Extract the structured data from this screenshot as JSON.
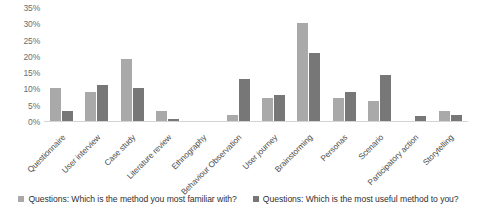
{
  "chart_data": {
    "type": "bar",
    "title": "",
    "subtitle": "",
    "xlabel": "",
    "ylabel": "",
    "ylim": [
      0,
      35
    ],
    "ytick_labels": [
      "35%",
      "30%",
      "25%",
      "20%",
      "15%",
      "10%",
      "5%",
      "0%"
    ],
    "ytick_values": [
      35,
      30,
      25,
      20,
      15,
      10,
      5,
      0
    ],
    "grid": false,
    "legend_position": "bottom",
    "value_unit": "%",
    "categories": [
      "Questionnaire",
      "User interview",
      "Case study",
      "Literature review",
      "Ethnography",
      "Behaviour Observation",
      "User journey",
      "Brainstorming",
      "Personas",
      "Scenario",
      "Participatory action",
      "Storytelling"
    ],
    "series": [
      {
        "name": "Questions: Which is the method you most familiar with?",
        "color": "#a9a9a9",
        "values": [
          10,
          9,
          19,
          3,
          0,
          2,
          7,
          30,
          7,
          6,
          0,
          3
        ]
      },
      {
        "name": "Questions: Which is the most useful method to you?",
        "color": "#777777",
        "values": [
          3,
          11,
          10,
          0.5,
          0,
          13,
          8,
          21,
          9,
          14,
          1.5,
          2
        ]
      }
    ]
  },
  "legend": {
    "items": [
      {
        "marker": "legend-swatch-series-1",
        "label": "Questions: Which is the method you most familiar with?"
      },
      {
        "marker": "legend-swatch-series-2",
        "label": "Questions: Which is the most useful method to you?"
      }
    ]
  }
}
